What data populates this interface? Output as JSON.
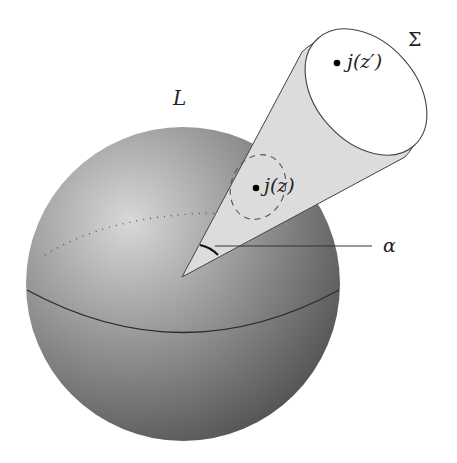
{
  "figure": {
    "type": "geometric diagram: sphere with cone",
    "labels": {
      "sphere": "L",
      "surface": "Σ",
      "point_far": "j(z′)",
      "point_near": "j(z)",
      "angle": "α"
    },
    "colors": {
      "sphere_light": "#d8d8d8",
      "sphere_dark": "#555555",
      "cone_fill": "#dcdcdc",
      "cap_fill": "#ffffff",
      "stroke": "#333333"
    }
  }
}
